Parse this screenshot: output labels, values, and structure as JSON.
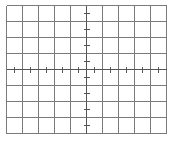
{
  "graticule": {
    "origin_x": 6,
    "origin_y": 5,
    "cols": 10,
    "rows": 8,
    "cell": 16,
    "line_color": "#7a7a7a",
    "tick_color": "#555555",
    "line_width": 1,
    "tick_half_length": 3,
    "minor_ticks_per_division": 2
  }
}
